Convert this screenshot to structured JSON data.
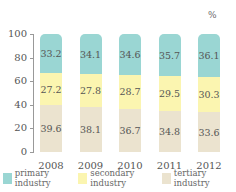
{
  "chart_data": {
    "type": "bar",
    "stacked": true,
    "unit": "%",
    "title": "",
    "xlabel": "",
    "ylabel": "",
    "ylim": [
      0,
      100
    ],
    "yticks": [
      "0",
      "20",
      "40",
      "60",
      "80",
      "100"
    ],
    "categories": [
      "2008",
      "2009",
      "2010",
      "2011",
      "2012"
    ],
    "series": [
      {
        "name": "tertiary industry",
        "color": "#ebe3cf",
        "values": [
          39.6,
          38.1,
          36.7,
          34.8,
          33.6
        ]
      },
      {
        "name": "secondary industry",
        "color": "#fbf5b0",
        "values": [
          27.2,
          27.8,
          28.7,
          29.5,
          30.3
        ]
      },
      {
        "name": "primary industry",
        "color": "#9ad6d3",
        "values": [
          33.2,
          34.1,
          34.6,
          35.7,
          36.1
        ]
      }
    ],
    "labels": {
      "primary": [
        "33.2",
        "34.1",
        "34.6",
        "35.7",
        "36.1"
      ],
      "secondary": [
        "27.2",
        "27.8",
        "28.7",
        "29.5",
        "30.3"
      ],
      "tertiary": [
        "39.6",
        "38.1",
        "36.7",
        "34.8",
        "33.6"
      ]
    },
    "legend": {
      "position": "bottom",
      "items": [
        {
          "label": "primary industry",
          "color": "#9ad6d3"
        },
        {
          "label": "secondary industry",
          "color": "#fbf5b0"
        },
        {
          "label": "tertiary industry",
          "color": "#ebe3cf"
        }
      ]
    },
    "grid": false
  }
}
